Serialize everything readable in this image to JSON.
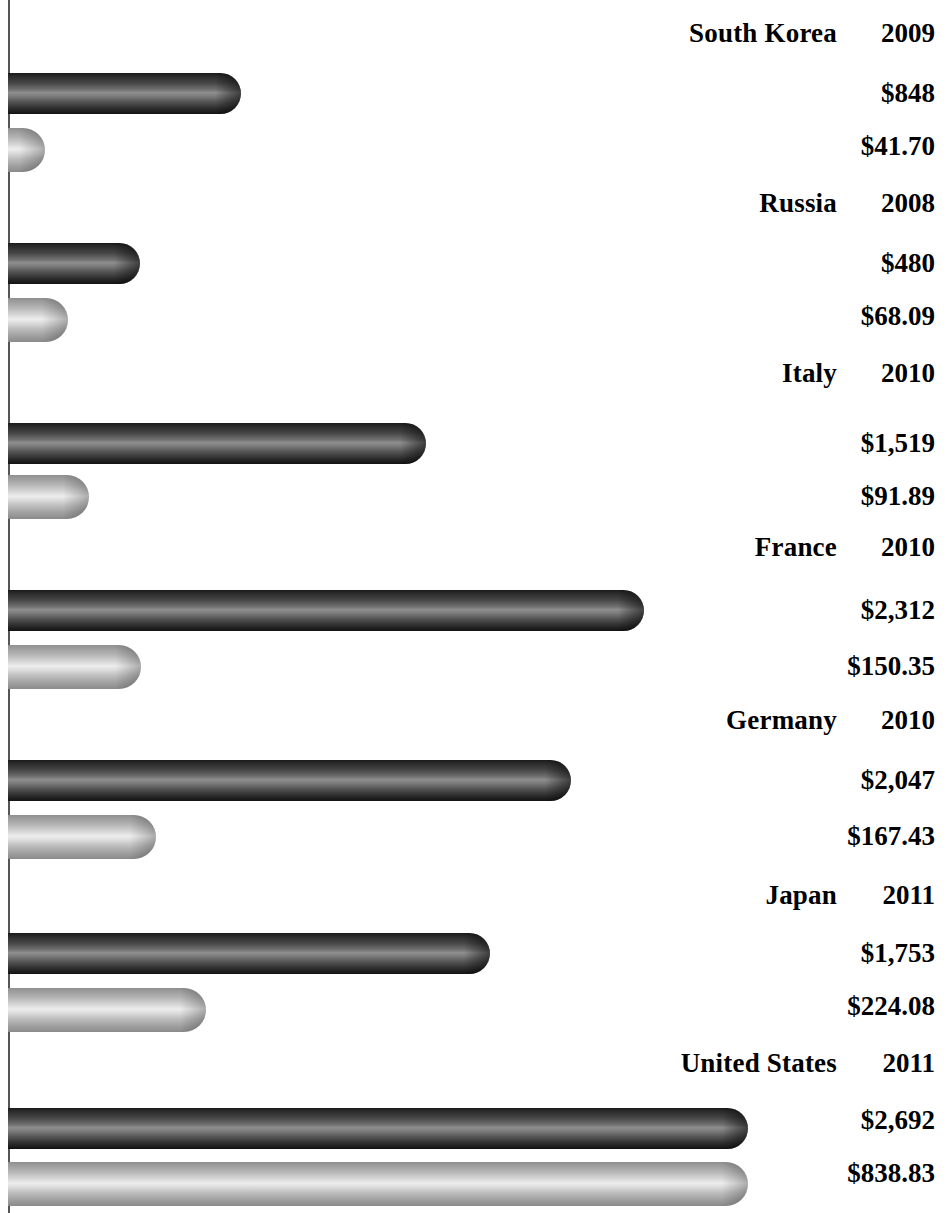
{
  "chart": {
    "type": "bar",
    "orientation": "horizontal",
    "background_color": "#FFFFFF",
    "axis_color": "#555555",
    "series_primary_color": "#3A3A3A",
    "series_secondary_color": "#C0C0C0"
  },
  "chart_data": {
    "type": "bar",
    "title": "",
    "subtitle": "",
    "xlabel": "",
    "ylabel": "",
    "orientation": "horizontal",
    "grid": false,
    "legend": "none",
    "categories": [
      "South Korea",
      "Russia",
      "Italy",
      "France",
      "Germany",
      "Japan",
      "United States"
    ],
    "years": [
      "2009",
      "2008",
      "2010",
      "2010",
      "2010",
      "2011",
      "2011"
    ],
    "series": [
      {
        "name": "primary",
        "value_labels": [
          "$848",
          "$480",
          "$1,519",
          "$2,312",
          "$2,047",
          "$1,753",
          "$2,692"
        ],
        "values": [
          848,
          480,
          1519,
          2312,
          2047,
          1753,
          2692
        ],
        "axis_max": 2692
      },
      {
        "name": "secondary",
        "value_labels": [
          "$41.70",
          "$68.09",
          "$91.89",
          "$150.35",
          "$167.43",
          "$224.08",
          "$838.83"
        ],
        "values": [
          41.7,
          68.09,
          91.89,
          150.35,
          167.43,
          224.08,
          838.83
        ],
        "axis_max": 838.83
      }
    ]
  },
  "groups": [
    {
      "name": "South Korea",
      "year": "2009",
      "primary_label": "$848",
      "secondary_label": "$41.70",
      "primary_value": 848,
      "secondary_value": 41.7
    },
    {
      "name": "Russia",
      "year": "2008",
      "primary_label": "$480",
      "secondary_label": "$68.09",
      "primary_value": 480,
      "secondary_value": 68.09
    },
    {
      "name": "Italy",
      "year": "2010",
      "primary_label": "$1,519",
      "secondary_label": "$91.89",
      "primary_value": 1519,
      "secondary_value": 91.89
    },
    {
      "name": "France",
      "year": "2010",
      "primary_label": "$2,312",
      "secondary_label": "$150.35",
      "primary_value": 2312,
      "secondary_value": 150.35
    },
    {
      "name": "Germany",
      "year": "2010",
      "primary_label": "$2,047",
      "secondary_label": "$167.43",
      "primary_value": 2047,
      "secondary_value": 167.43
    },
    {
      "name": "Japan",
      "year": "2011",
      "primary_label": "$1,753",
      "secondary_label": "$224.08",
      "primary_value": 1753,
      "secondary_value": 224.08
    },
    {
      "name": "United States",
      "year": "2011",
      "primary_label": "$2,692",
      "secondary_label": "$838.83",
      "primary_value": 2692,
      "secondary_value": 838.83
    }
  ],
  "layout": {
    "bar_origin_x": 8,
    "primary_px_per_unit": 0.2749,
    "secondary_px_per_unit": 0.8821,
    "rows": [
      {
        "label_y": 18,
        "primary_bar_y": 73,
        "primary_label_y": 78,
        "secondary_bar_y": 128,
        "secondary_label_y": 131
      },
      {
        "label_y": 188,
        "primary_bar_y": 243,
        "primary_label_y": 248,
        "secondary_bar_y": 298,
        "secondary_label_y": 301
      },
      {
        "label_y": 358,
        "primary_bar_y": 423,
        "primary_label_y": 428,
        "secondary_bar_y": 475,
        "secondary_label_y": 481
      },
      {
        "label_y": 532,
        "primary_bar_y": 590,
        "primary_label_y": 595,
        "secondary_bar_y": 645,
        "secondary_label_y": 651
      },
      {
        "label_y": 705,
        "primary_bar_y": 760,
        "primary_label_y": 765,
        "secondary_bar_y": 815,
        "secondary_label_y": 821
      },
      {
        "label_y": 880,
        "primary_bar_y": 933,
        "primary_label_y": 938,
        "secondary_bar_y": 988,
        "secondary_label_y": 991
      },
      {
        "label_y": 1048,
        "primary_bar_y": 1108,
        "primary_label_y": 1105,
        "secondary_bar_y": 1162,
        "secondary_label_y": 1158
      }
    ],
    "bar_height_primary": 41,
    "bar_height_secondary": 44
  }
}
